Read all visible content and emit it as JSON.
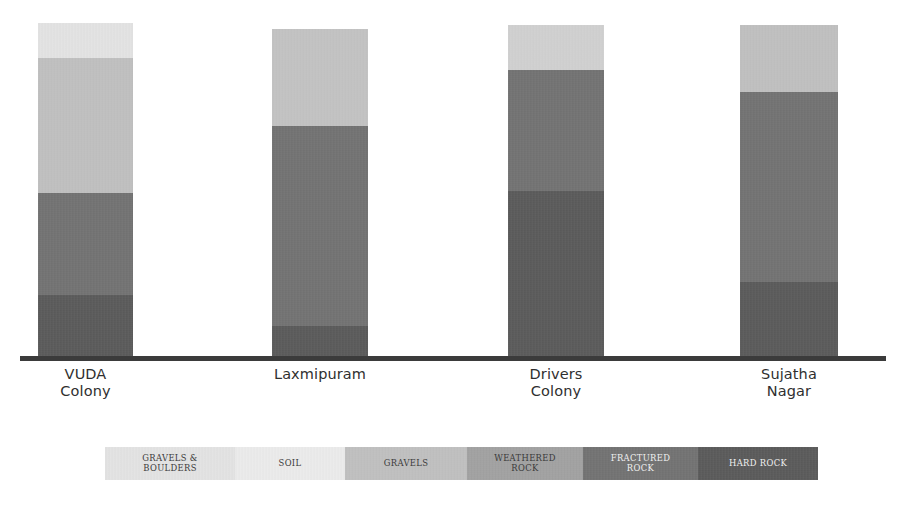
{
  "chart_data": {
    "type": "bar",
    "subtype": "stacked-column",
    "title": "",
    "subtitle": "",
    "xlabel": "",
    "ylabel": "",
    "grid": false,
    "axis": {
      "baseline": true,
      "y_axis_visible": false,
      "tick_labels": []
    },
    "categories": [
      "VUDA\nColony",
      "Laxmipuram",
      "Drivers\nColony",
      "Sujatha\nNagar"
    ],
    "series": [
      {
        "name": "GRAVELS & BOULDERS",
        "color": "#e9e9e9",
        "values": [
          35,
          0,
          45,
          0
        ]
      },
      {
        "name": "SOIL",
        "color": "#f2f2f2",
        "values": [
          0,
          0,
          0,
          0
        ]
      },
      {
        "name": "GRAVELS",
        "color": "#c3c3c3",
        "values": [
          135,
          97,
          0,
          67
        ]
      },
      {
        "name": "WEATHERED ROCK",
        "color": "#a2a2a2",
        "values": [
          0,
          0,
          0,
          0
        ]
      },
      {
        "name": "FRACTURED ROCK",
        "color": "#6f6f6f",
        "values": [
          102,
          200,
          121,
          190
        ]
      },
      {
        "name": "HARD ROCK",
        "color": "#555555",
        "values": [
          63,
          32,
          167,
          76
        ]
      }
    ],
    "legend": {
      "position": "bottom",
      "entries": [
        {
          "label": "GRAVELS &\nBOULDERS",
          "color": "#e9e9e9",
          "text_color": "#3a3a3a",
          "width": 130
        },
        {
          "label": "SOIL",
          "color": "#f2f2f2",
          "text_color": "#3a3a3a",
          "width": 110
        },
        {
          "label": "GRAVELS",
          "color": "#c3c3c3",
          "text_color": "#3a3a3a",
          "width": 122
        },
        {
          "label": "WEATHERED\nROCK",
          "color": "#a2a2a2",
          "text_color": "#3a3a3a",
          "width": 116
        },
        {
          "label": "FRACTURED\nROCK",
          "color": "#6f6f6f",
          "text_color": "#f0f0f0",
          "width": 115
        },
        {
          "label": "HARD ROCK",
          "color": "#555555",
          "text_color": "#f0f0f0",
          "width": 120
        }
      ]
    },
    "bars": [
      {
        "category": "VUDA\nColony",
        "label_line1": "VUDA",
        "label_line2": "Colony",
        "x": 38,
        "width": 95,
        "top": 23,
        "segments": [
          {
            "name": "GRAVELS & BOULDERS",
            "color": "#e9e9e9",
            "height": 35
          },
          {
            "name": "GRAVELS",
            "color": "#c3c3c3",
            "height": 135
          },
          {
            "name": "FRACTURED ROCK",
            "color": "#6f6f6f",
            "height": 102
          },
          {
            "name": "HARD ROCK",
            "color": "#555555",
            "height": 63
          }
        ]
      },
      {
        "category": "Laxmipuram",
        "label_line1": "Laxmipuram",
        "label_line2": "",
        "x": 272,
        "width": 96,
        "top": 29,
        "segments": [
          {
            "name": "GRAVELS",
            "color": "#c6c6c6",
            "height": 97
          },
          {
            "name": "FRACTURED ROCK",
            "color": "#6f6f6f",
            "height": 200
          },
          {
            "name": "HARD ROCK",
            "color": "#555555",
            "height": 32
          }
        ]
      },
      {
        "category": "Drivers\nColony",
        "label_line1": "Drivers",
        "label_line2": "Colony",
        "x": 508,
        "width": 96,
        "top": 25,
        "segments": [
          {
            "name": "GRAVELS & BOULDERS",
            "color": "#d5d5d5",
            "height": 45
          },
          {
            "name": "FRACTURED ROCK",
            "color": "#6f6f6f",
            "height": 121
          },
          {
            "name": "HARD ROCK",
            "color": "#555555",
            "height": 167
          }
        ]
      },
      {
        "category": "Sujatha\nNagar",
        "label_line1": "Sujatha",
        "label_line2": "Nagar",
        "x": 740,
        "width": 98,
        "top": 25,
        "segments": [
          {
            "name": "GRAVELS",
            "color": "#c3c3c3",
            "height": 67
          },
          {
            "name": "FRACTURED ROCK",
            "color": "#6f6f6f",
            "height": 190
          },
          {
            "name": "HARD ROCK",
            "color": "#555555",
            "height": 76
          }
        ]
      }
    ],
    "colors": {
      "axis": "#3b3b3b",
      "label_text": "#2f2f2f",
      "background": "#ffffff"
    }
  }
}
